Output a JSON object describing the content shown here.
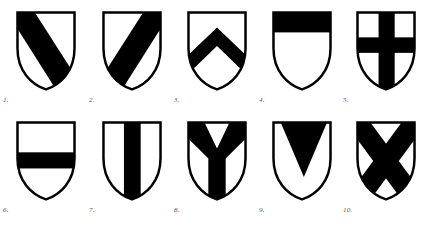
{
  "plate": {
    "background_color": "#ffffff",
    "ink_color": "#000000",
    "label_color": "#5a5a5a",
    "rows": 2,
    "columns": 5,
    "total_figures": 10
  },
  "figures": [
    {
      "number": "1.",
      "name": "bend",
      "charge": "bend",
      "description": "Diagonal band from dexter chief to sinister base",
      "tincture_field": "argent",
      "tincture_charge": "sable"
    },
    {
      "number": "2.",
      "name": "bend-sinister",
      "charge": "bend sinister",
      "description": "Diagonal band from sinister chief to dexter base",
      "tincture_field": "argent",
      "tincture_charge": "sable"
    },
    {
      "number": "3.",
      "name": "chevron",
      "charge": "chevron",
      "description": "Inverted V band with apex toward chief",
      "tincture_field": "argent",
      "tincture_charge": "sable"
    },
    {
      "number": "4.",
      "name": "chief",
      "charge": "chief",
      "description": "Horizontal band across the top of the shield",
      "tincture_field": "argent",
      "tincture_charge": "sable"
    },
    {
      "number": "5.",
      "name": "cross",
      "charge": "cross",
      "description": "Vertical and horizontal bands crossing at centre",
      "tincture_field": "argent",
      "tincture_charge": "sable"
    },
    {
      "number": "6.",
      "name": "fess",
      "charge": "fess",
      "description": "Horizontal band across the middle of the shield",
      "tincture_field": "argent",
      "tincture_charge": "sable"
    },
    {
      "number": "7.",
      "name": "pale",
      "charge": "pale",
      "description": "Vertical band down the centre of the shield",
      "tincture_field": "argent",
      "tincture_charge": "sable"
    },
    {
      "number": "8.",
      "name": "pall",
      "charge": "pall",
      "description": "Y-shaped band meeting at fess point",
      "tincture_field": "argent",
      "tincture_charge": "sable"
    },
    {
      "number": "9.",
      "name": "pile",
      "charge": "pile",
      "description": "Wedge descending from chief to a point in base",
      "tincture_field": "argent",
      "tincture_charge": "sable"
    },
    {
      "number": "10.",
      "name": "saltire",
      "charge": "saltire",
      "description": "Diagonal cross in the form of an X",
      "tincture_field": "argent",
      "tincture_charge": "sable"
    }
  ]
}
